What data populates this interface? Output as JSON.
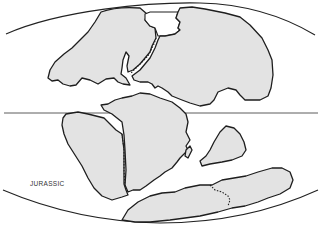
{
  "map": {
    "period_label": "JURASSIC",
    "projection": "oval (Mollweide-like) world map",
    "features": {
      "equator_line": true,
      "landmasses": [
        "laurasia-west",
        "laurasia-east",
        "north-america-africa-join",
        "south-america",
        "africa",
        "india",
        "antarctica-australia"
      ]
    },
    "colors": {
      "land_fill": "#e3e3e3",
      "outline": "#1e1e1e",
      "background": "#ffffff"
    }
  }
}
